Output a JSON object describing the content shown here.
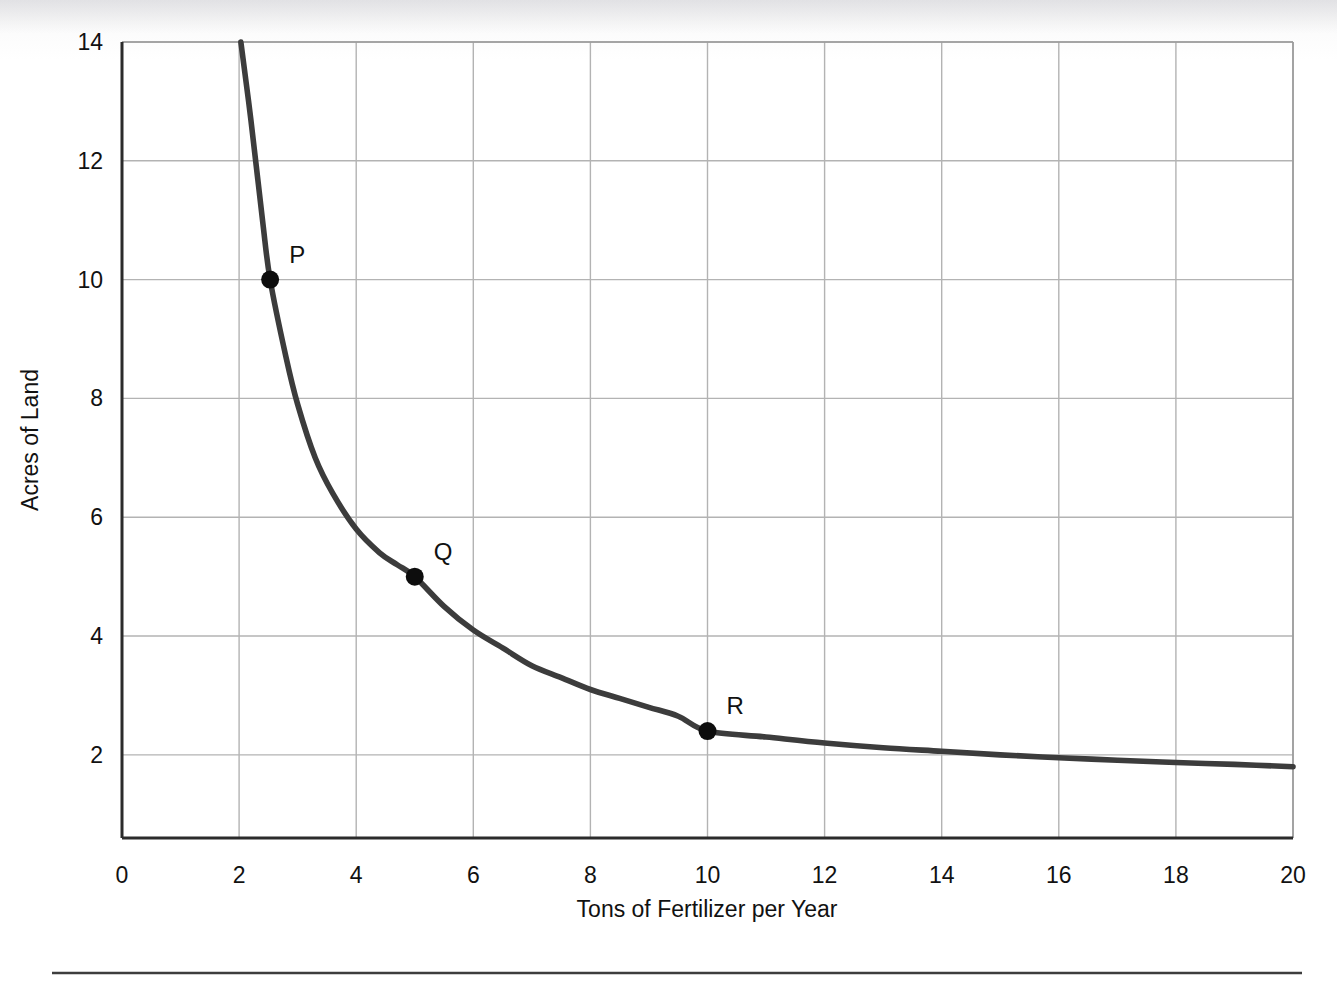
{
  "figure": {
    "background_color": "#ffffff",
    "curve_color": "#3c3c3c",
    "grid_color": "#b3b3b3",
    "axis_color": "#2b2b2b",
    "marker_color": "#0d0d0d"
  },
  "chart_data": {
    "type": "line",
    "title": "",
    "subtitle": "",
    "xlabel": "Tons of Fertilizer per Year",
    "ylabel": "Acres of Land",
    "xlim": [
      0,
      20
    ],
    "ylim": [
      0.6,
      14
    ],
    "x_ticks": [
      0,
      2,
      4,
      6,
      8,
      10,
      12,
      14,
      16,
      18,
      20
    ],
    "x_tick_labels": [
      "0",
      "2",
      "4",
      "6",
      "8",
      "10",
      "12",
      "14",
      "16",
      "18",
      "20"
    ],
    "y_ticks": [
      2,
      4,
      6,
      8,
      10,
      12,
      14
    ],
    "y_tick_labels": [
      "2",
      "4",
      "6",
      "8",
      "10",
      "12",
      "14"
    ],
    "grid": true,
    "legend": false,
    "legend_position": "none",
    "series": [
      {
        "name": "Isoquant",
        "x": [
          2.03,
          2.2,
          2.4,
          2.53,
          2.8,
          3.0,
          3.3,
          3.6,
          4.0,
          4.4,
          4.7,
          5.0,
          5.5,
          6.0,
          6.5,
          7.0,
          7.5,
          8.0,
          8.5,
          9.0,
          9.5,
          10.0,
          11.0,
          12.0,
          13.0,
          14.0,
          15.0,
          16.0,
          17.0,
          18.0,
          19.0,
          20.0
        ],
        "y": [
          14.0,
          12.7,
          11.0,
          10.0,
          8.7,
          7.9,
          7.0,
          6.4,
          5.8,
          5.4,
          5.2,
          5.0,
          4.5,
          4.1,
          3.8,
          3.5,
          3.3,
          3.1,
          2.95,
          2.8,
          2.65,
          2.4,
          2.3,
          2.2,
          2.12,
          2.06,
          2.0,
          1.95,
          1.91,
          1.87,
          1.84,
          1.8
        ]
      }
    ],
    "annotations": [
      {
        "label": "P",
        "x": 2.53,
        "y": 10.0,
        "marker": true
      },
      {
        "label": "Q",
        "x": 5.0,
        "y": 5.0,
        "marker": true
      },
      {
        "label": "R",
        "x": 10.0,
        "y": 2.4,
        "marker": true
      }
    ]
  }
}
